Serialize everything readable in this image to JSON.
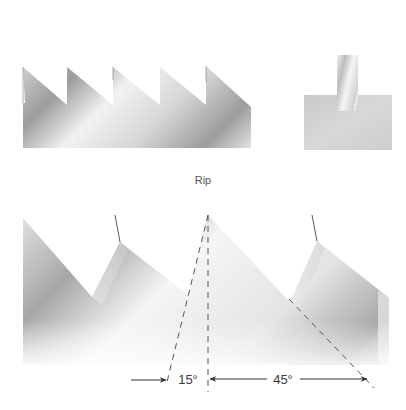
{
  "diagram": {
    "caption": "Rip",
    "top_saw": {
      "name": "rip-saw-teeth-side-view",
      "teeth_count": 5
    },
    "kerf_view": {
      "name": "rip-cut-kerf-end-view"
    },
    "bottom_saw": {
      "name": "rip-tooth-angle-detail"
    },
    "angles": {
      "rake": "15°",
      "bevel": "45°"
    },
    "colors": {
      "steel_dark": "#8a8a8a",
      "steel_mid": "#c4c4c4",
      "steel_light": "#f4f4f4",
      "block": "#cfcfcf",
      "line": "#555555"
    }
  }
}
